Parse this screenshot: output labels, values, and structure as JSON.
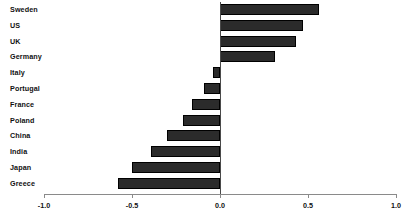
{
  "chart_data": {
    "type": "bar",
    "orientation": "horizontal",
    "title": "",
    "subtitle": "",
    "xlabel": "",
    "ylabel": "",
    "xlim": [
      -1.0,
      1.0
    ],
    "grid": false,
    "legend": null,
    "zero_line": true,
    "bar_color": "#2b2b2b",
    "axis_color": "#8a8a8a",
    "xticks": [
      -1.0,
      -0.5,
      0.0,
      0.5,
      1.0
    ],
    "xtick_labels": [
      "-1.0",
      "-0.5",
      "0.0",
      "0.5",
      "1.0"
    ],
    "categories": [
      "Sweden",
      "US",
      "UK",
      "Germany",
      "Italy",
      "Portugal",
      "France",
      "Poland",
      "China",
      "India",
      "Japan",
      "Greece"
    ],
    "values": [
      0.56,
      0.47,
      0.43,
      0.31,
      -0.04,
      -0.09,
      -0.16,
      -0.21,
      -0.3,
      -0.39,
      -0.5,
      -0.58
    ],
    "bars": [
      {
        "category": "Sweden",
        "value": 0.56
      },
      {
        "category": "US",
        "value": 0.47
      },
      {
        "category": "UK",
        "value": 0.43
      },
      {
        "category": "Germany",
        "value": 0.31
      },
      {
        "category": "Italy",
        "value": -0.04
      },
      {
        "category": "Portugal",
        "value": -0.09
      },
      {
        "category": "France",
        "value": -0.16
      },
      {
        "category": "Poland",
        "value": -0.21
      },
      {
        "category": "China",
        "value": -0.3
      },
      {
        "category": "India",
        "value": -0.39
      },
      {
        "category": "Japan",
        "value": -0.5
      },
      {
        "category": "Greece",
        "value": -0.58
      }
    ]
  }
}
